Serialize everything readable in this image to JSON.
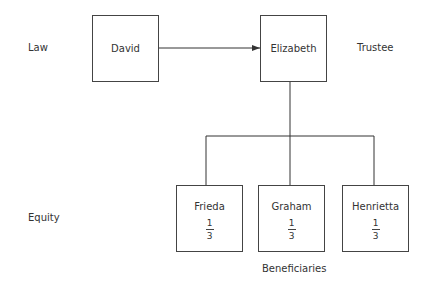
{
  "labels": {
    "law": "Law",
    "equity": "Equity",
    "trustee": "Trustee",
    "beneficiaries": "Beneficiaries"
  },
  "nodes": {
    "settlor": {
      "name": "David"
    },
    "trustee": {
      "name": "Elizabeth"
    },
    "beneficiaries": [
      {
        "name": "Frieda",
        "share_num": "1",
        "share_den": "3"
      },
      {
        "name": "Graham",
        "share_num": "1",
        "share_den": "3"
      },
      {
        "name": "Henrietta",
        "share_num": "1",
        "share_den": "3"
      }
    ]
  },
  "edges": [
    {
      "from": "David",
      "to": "Elizabeth",
      "type": "arrow"
    },
    {
      "from": "Elizabeth",
      "to": "Frieda",
      "type": "tree"
    },
    {
      "from": "Elizabeth",
      "to": "Graham",
      "type": "tree"
    },
    {
      "from": "Elizabeth",
      "to": "Henrietta",
      "type": "tree"
    }
  ],
  "colors": {
    "line": "#333333",
    "text": "#333333",
    "background": "#ffffff"
  }
}
